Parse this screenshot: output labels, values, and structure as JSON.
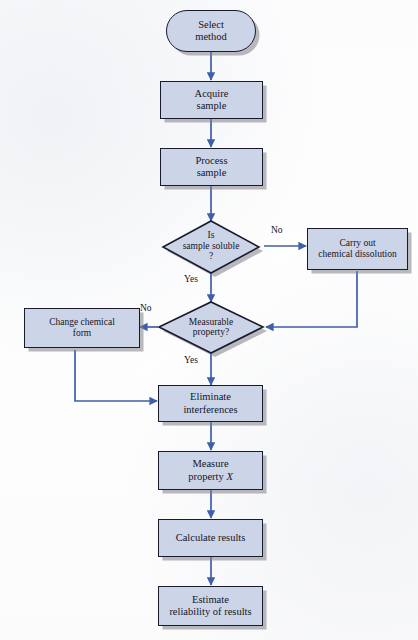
{
  "figure": {
    "type": "flowchart",
    "palette": {
      "node_fill": "#ccd4e8",
      "node_border": "#1a1a2e",
      "node_shadow": "#828287",
      "connector": "#3f5fa8",
      "text": "#15151f",
      "background": "#fdfdfd"
    }
  },
  "nodes": [
    {
      "id": "select-method",
      "shape": "terminator",
      "label_line1": "Select",
      "label_line2": "method",
      "font_size": 10.5
    },
    {
      "id": "acquire-sample",
      "shape": "process",
      "label_line1": "Acquire",
      "label_line2": "sample",
      "font_size": 10.5
    },
    {
      "id": "process-sample",
      "shape": "process",
      "label_line1": "Process",
      "label_line2": "sample",
      "font_size": 10.5
    },
    {
      "id": "is-sample-soluble",
      "shape": "decision",
      "label_line1": "Is",
      "label_line2": "sample soluble",
      "label_line3": "?",
      "font_size": 9.5
    },
    {
      "id": "carry-out-chemical-dissolution",
      "shape": "process",
      "label_line1": "Carry out",
      "label_line2": "chemical dissolution",
      "font_size": 9.5
    },
    {
      "id": "measurable-property",
      "shape": "decision",
      "label_line1": "Measurable",
      "label_line2": "property?",
      "font_size": 9.5
    },
    {
      "id": "change-chemical-form",
      "shape": "process",
      "label_line1": "Change chemical",
      "label_line2": "form",
      "font_size": 9.5
    },
    {
      "id": "eliminate-interferences",
      "shape": "process",
      "label_line1": "Eliminate",
      "label_line2": "interferences",
      "font_size": 10.5
    },
    {
      "id": "measure-property-x",
      "shape": "process",
      "label_line1": "Measure",
      "label_line2": "property X",
      "label_line2_italic_tail": "X",
      "font_size": 10.5
    },
    {
      "id": "calculate-results",
      "shape": "process",
      "label_line1": "Calculate results",
      "label_line2": "",
      "font_size": 10.5
    },
    {
      "id": "estimate-reliability",
      "shape": "process",
      "label_line1": "Estimate",
      "label_line2": "reliability of results",
      "font_size": 10.5
    }
  ],
  "edge_labels": {
    "soluble_no": "No",
    "soluble_yes": "Yes",
    "measurable_no": "No",
    "measurable_yes": "Yes"
  },
  "edges": [
    {
      "from": "select-method",
      "to": "acquire-sample",
      "label": ""
    },
    {
      "from": "acquire-sample",
      "to": "process-sample",
      "label": ""
    },
    {
      "from": "process-sample",
      "to": "is-sample-soluble",
      "label": ""
    },
    {
      "from": "is-sample-soluble",
      "to": "carry-out-chemical-dissolution",
      "label": "No"
    },
    {
      "from": "is-sample-soluble",
      "to": "measurable-property",
      "label": "Yes"
    },
    {
      "from": "carry-out-chemical-dissolution",
      "to": "measurable-property",
      "label": ""
    },
    {
      "from": "measurable-property",
      "to": "change-chemical-form",
      "label": "No"
    },
    {
      "from": "measurable-property",
      "to": "eliminate-interferences",
      "label": "Yes"
    },
    {
      "from": "change-chemical-form",
      "to": "eliminate-interferences",
      "label": ""
    },
    {
      "from": "eliminate-interferences",
      "to": "measure-property-x",
      "label": ""
    },
    {
      "from": "measure-property-x",
      "to": "calculate-results",
      "label": ""
    },
    {
      "from": "calculate-results",
      "to": "estimate-reliability",
      "label": ""
    }
  ]
}
